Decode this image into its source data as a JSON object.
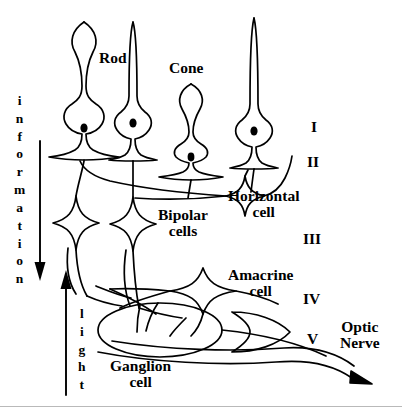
{
  "diagram": {
    "background_color": "#ffffff",
    "stroke_color": "#000000",
    "rule_color": "#b9b9b9",
    "width": 402,
    "height": 418
  },
  "labels": {
    "rod": "Rod",
    "cone": "Cone",
    "horizontal_cell_line1": "Horizontal",
    "horizontal_cell_line2": "cell",
    "bipolar_cells_line1": "Bipolar",
    "bipolar_cells_line2": "cells",
    "amacrine_cell_line1": "Amacrine",
    "amacrine_cell_line2": "cell",
    "ganglion_cell_line1": "Ganglion",
    "ganglion_cell_line2": "cell",
    "optic_nerve_line1": "Optic",
    "optic_nerve_line2": "Nerve"
  },
  "layers": {
    "I": "I",
    "II": "II",
    "III": "III",
    "IV": "IV",
    "V": "V"
  },
  "axes": {
    "information": {
      "word": "information",
      "letters": [
        "i",
        "n",
        "f",
        "o",
        "r",
        "m",
        "a",
        "t",
        "i",
        "o",
        "n"
      ],
      "direction": "down"
    },
    "light": {
      "word": "light",
      "letters": [
        "l",
        "i",
        "g",
        "h",
        "t"
      ],
      "direction": "up"
    }
  }
}
